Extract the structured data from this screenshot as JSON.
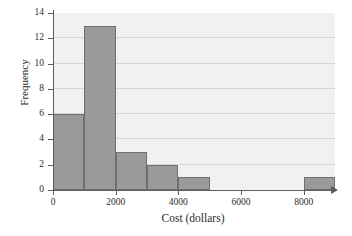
{
  "chart_data": {
    "type": "bar",
    "subtype": "histogram",
    "title": "",
    "xlabel": "Cost (dollars)",
    "ylabel": "Frequency",
    "xlim": [
      0,
      9000
    ],
    "ylim": [
      0,
      14
    ],
    "bin_width": 1000,
    "grid": true,
    "legend": null,
    "bar_color": "#9a9a9a",
    "bar_edge_color": "#6f6f6f",
    "plot_background": "#f1f1f1",
    "gridline_color": "#d6d6d6",
    "axis_color": "#5c5c5c",
    "x_ticks": [
      0,
      2000,
      4000,
      6000,
      8000
    ],
    "x_tick_labels": [
      "0",
      "2000",
      "4000",
      "6000",
      "8000"
    ],
    "y_ticks": [
      0,
      2,
      4,
      6,
      8,
      10,
      12,
      14
    ],
    "y_tick_labels": [
      "0",
      "2",
      "4",
      "6",
      "8",
      "10",
      "12",
      "14"
    ],
    "bins": [
      {
        "start": 0,
        "end": 1000,
        "value": 6
      },
      {
        "start": 1000,
        "end": 2000,
        "value": 13
      },
      {
        "start": 2000,
        "end": 3000,
        "value": 3
      },
      {
        "start": 3000,
        "end": 4000,
        "value": 2
      },
      {
        "start": 4000,
        "end": 5000,
        "value": 1
      },
      {
        "start": 8000,
        "end": 9000,
        "value": 1
      }
    ],
    "categories": [
      "0-1000",
      "1000-2000",
      "2000-3000",
      "3000-4000",
      "4000-5000",
      "5000-6000",
      "6000-7000",
      "7000-8000",
      "8000-9000"
    ],
    "values": [
      6,
      13,
      3,
      2,
      1,
      0,
      0,
      0,
      1
    ]
  }
}
